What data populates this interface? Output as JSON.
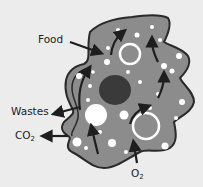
{
  "diagram": {
    "labels": {
      "food": "Food",
      "wastes": "Wastes",
      "co2_main": "CO",
      "co2_sub": "2",
      "o2_main": "O",
      "o2_sub": "2"
    },
    "colors": {
      "background": "#ececec",
      "cytoplasm": "#8c8c8c",
      "outline": "#2a2a2a",
      "nucleus": "#3a3a3a",
      "vacuole": "#ffffff",
      "arrow": "#1e1e1e",
      "text": "#222222"
    }
  }
}
